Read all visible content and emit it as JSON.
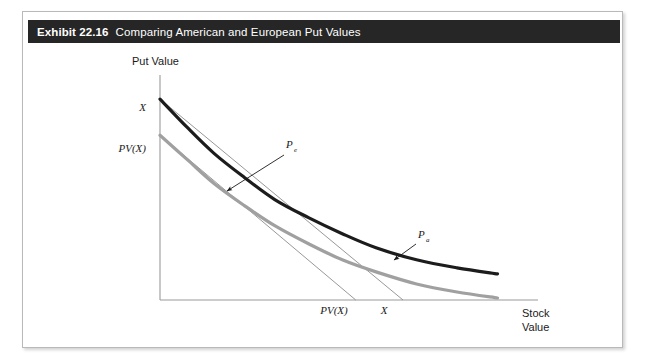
{
  "exhibit": {
    "label": "Exhibit 22.16",
    "caption": "Comparing American and European Put Values",
    "header_bg": "#262626",
    "header_text_color": "#ffffff",
    "frame_border_color": "#b9b9b9",
    "background": "#ffffff"
  },
  "chart_data": {
    "type": "line",
    "title": "Comparing American and European Put Values",
    "xlabel_line1": "Stock",
    "xlabel_line2": "Value",
    "ylabel": "Put Value",
    "grid": false,
    "legend_position": "inline-annotation",
    "axis_color": "#9a9a9a",
    "y_ticks": [
      {
        "label": "X",
        "value": 1.0
      },
      {
        "label": "PV(X)",
        "value": 0.82
      }
    ],
    "x_ticks": [
      {
        "label": "PV(X)",
        "value": 0.58
      },
      {
        "label": "X",
        "value": 0.72
      }
    ],
    "series": [
      {
        "name": "P",
        "subscript": "a",
        "description": "American put value curve",
        "color": "#1c1c1c",
        "width": 3.2,
        "x": [
          0.0,
          0.08,
          0.16,
          0.25,
          0.34,
          0.44,
          0.54,
          0.64,
          0.76,
          0.88,
          1.0
        ],
        "y": [
          1.0,
          0.86,
          0.73,
          0.61,
          0.5,
          0.41,
          0.33,
          0.26,
          0.2,
          0.16,
          0.13
        ]
      },
      {
        "name": "P",
        "subscript": "e",
        "description": "European put value curve",
        "color": "#a0a0a0",
        "width": 3.2,
        "x": [
          0.0,
          0.08,
          0.16,
          0.25,
          0.34,
          0.44,
          0.54,
          0.64,
          0.76,
          0.88,
          1.0
        ],
        "y": [
          0.82,
          0.7,
          0.58,
          0.47,
          0.37,
          0.28,
          0.2,
          0.14,
          0.08,
          0.04,
          0.01
        ]
      },
      {
        "name": "intrinsic-value-X",
        "description": "Straight line from X on the put-value axis to X on the stock-value axis",
        "color": "#8c8c8c",
        "width": 0.9,
        "x": [
          0.0,
          0.72
        ],
        "y": [
          1.0,
          0.0
        ]
      },
      {
        "name": "intrinsic-value-PVX",
        "description": "Straight line from PV(X) on the put-value axis to PV(X) on the stock-value axis",
        "color": "#8c8c8c",
        "width": 0.9,
        "x": [
          0.0,
          0.58
        ],
        "y": [
          0.82,
          0.0
        ]
      }
    ],
    "annotations": [
      {
        "name": "european-put-label",
        "text": "P",
        "subscript": "e",
        "points_to": "European put value curve",
        "arrow": true
      },
      {
        "name": "american-put-label",
        "text": "P",
        "subscript": "a",
        "points_to": "American put value curve",
        "arrow": true
      }
    ],
    "xlim": [
      0,
      1.12
    ],
    "ylim": [
      0,
      1.12
    ]
  }
}
